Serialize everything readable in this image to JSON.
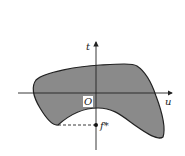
{
  "figure": {
    "axes": {
      "horizontal_label": "u",
      "vertical_label": "t",
      "origin_label": "O"
    },
    "point": {
      "label": "f*"
    },
    "colors": {
      "region_fill": "#8a8a8a",
      "stroke": "#222222",
      "background": "#ffffff"
    }
  }
}
